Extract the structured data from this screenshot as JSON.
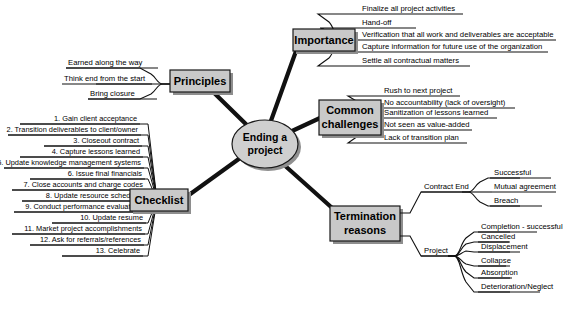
{
  "center": {
    "line1": "Ending a",
    "line2": "project"
  },
  "branches": {
    "principles": {
      "label": "Principles",
      "items": [
        "Earned along the way",
        "Think end from the start",
        "Bring closure"
      ]
    },
    "checklist": {
      "label": "Checklist",
      "items": [
        "1.  Gain client acceptance",
        "2.  Transition deliverables to client/owner",
        "3. Closeout contract",
        "4.  Capture lessons learned",
        "5.  Update knowledge management systems",
        "6.  Issue final financials",
        "7.  Close accounts and charge codes",
        "8.  Update resource schedules",
        "9.  Conduct performance evaluations",
        "10.  Update resume",
        "11.  Market project accomplishments",
        "12.  Ask for referrals/references",
        "13.  Celebrate"
      ]
    },
    "importance": {
      "label": "Importance",
      "items": [
        "Finalize all project activities",
        "Hand-off",
        "Verification that all work and deliverables are acceptable",
        "Capture information for future use of the organization",
        "Settle all contractual matters"
      ]
    },
    "common_challenges": {
      "label_line1": "Common",
      "label_line2": "challenges",
      "items": [
        "Rush to next project",
        "No accountability (lack of oversight)",
        "Sanitization of lessons learned",
        "Not seen as value-added",
        "Lack of transition plan"
      ]
    },
    "termination_reasons": {
      "label_line1": "Termination",
      "label_line2": "reasons",
      "subbranches": [
        {
          "label": "Contract End",
          "items": [
            "Successful",
            "Mutual agreement",
            "Breach"
          ]
        },
        {
          "label": "Project",
          "items": [
            "Completion - successful",
            "Cancelled",
            "Displacement",
            "Collapse",
            "Absorption",
            "Deterioration/Neglect"
          ]
        }
      ]
    }
  },
  "colors": {
    "box_fill": "#c9c9c9",
    "box_border": "#1a1a1a",
    "shadow": "#8e8e8e",
    "line": "#111111",
    "background": "#ffffff"
  }
}
